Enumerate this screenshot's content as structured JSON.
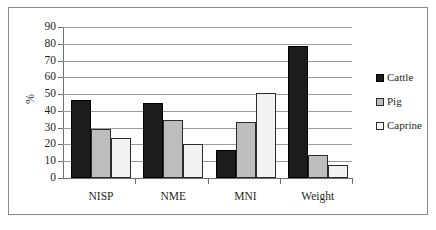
{
  "chart_data": {
    "type": "bar",
    "title": "",
    "xlabel": "",
    "ylabel": "%",
    "ylim": [
      0,
      90
    ],
    "ytick_step": 10,
    "yticks": [
      0,
      10,
      20,
      30,
      40,
      50,
      60,
      70,
      80,
      90
    ],
    "ytick_labels": [
      "0",
      "10",
      "20",
      "30",
      "40",
      "50",
      "60",
      "70",
      "80",
      "90"
    ],
    "grid": true,
    "grid_axis": "y",
    "legend_position": "right",
    "categories": [
      "NISP",
      "NME",
      "MNI",
      "Weight"
    ],
    "series": [
      {
        "name": "Cattle",
        "color": "#1c1c1c",
        "values": [
          46.5,
          45,
          16.5,
          78.5
        ]
      },
      {
        "name": "Pig",
        "color": "#bdbdbd",
        "values": [
          29,
          34.5,
          33.5,
          13.5
        ]
      },
      {
        "name": "Caprine",
        "color": "#f2f2f2",
        "values": [
          24,
          20,
          50.5,
          8
        ]
      }
    ]
  },
  "legend": {
    "items": [
      {
        "label": "Cattle",
        "key": "cattle"
      },
      {
        "label": "Pig",
        "key": "pig"
      },
      {
        "label": "Caprine",
        "key": "caprine"
      }
    ]
  },
  "axes": {
    "y_title": "%"
  }
}
